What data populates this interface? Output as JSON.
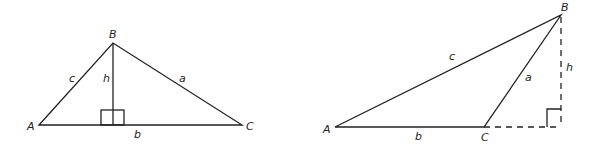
{
  "figures": [
    {
      "name": "acute-triangle",
      "vertices": {
        "A": "A",
        "B": "B",
        "C": "C"
      },
      "sides": {
        "a": "a",
        "b": "b",
        "c": "c"
      },
      "altitude": "h",
      "altitude_style": "solid, inside triangle"
    },
    {
      "name": "obtuse-triangle",
      "vertices": {
        "A": "A",
        "B": "B",
        "C": "C"
      },
      "sides": {
        "a": "a",
        "b": "b",
        "c": "c"
      },
      "altitude": "h",
      "altitude_style": "dashed, outside triangle with extended base"
    }
  ],
  "colors": {
    "stroke": "#222222",
    "background": "#ffffff"
  }
}
